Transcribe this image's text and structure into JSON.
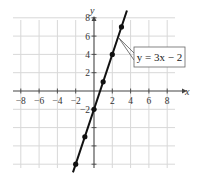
{
  "chart_data": {
    "type": "line",
    "title": "",
    "xlabel": "x",
    "ylabel": "y",
    "xlim": [
      -9,
      9
    ],
    "ylim": [
      -9,
      9
    ],
    "grid": true,
    "grid_step": 2,
    "x_ticks": [
      -8,
      -6,
      -4,
      -2,
      2,
      4,
      6,
      8
    ],
    "y_tick_labels": [
      8,
      6,
      4,
      2,
      -2
    ],
    "y_ticks_unlabeled": [
      -4,
      -6,
      -8
    ],
    "series": [
      {
        "name": "y = 3x − 2",
        "equation": "y = 3x − 2",
        "slope": 3,
        "intercept": -2,
        "x": [
          -2,
          -1,
          0,
          1,
          2,
          3
        ],
        "y": [
          -8,
          -5,
          -2,
          1,
          4,
          7
        ],
        "color": "#111111"
      }
    ],
    "annotations": [
      {
        "text": "y = 3x − 2",
        "points_to": [
          2.6,
          5.8
        ]
      }
    ],
    "legend": "callout box at upper right"
  },
  "labels": {
    "x_axis": "x",
    "y_axis": "y",
    "equation": "y = 3x − 2"
  }
}
